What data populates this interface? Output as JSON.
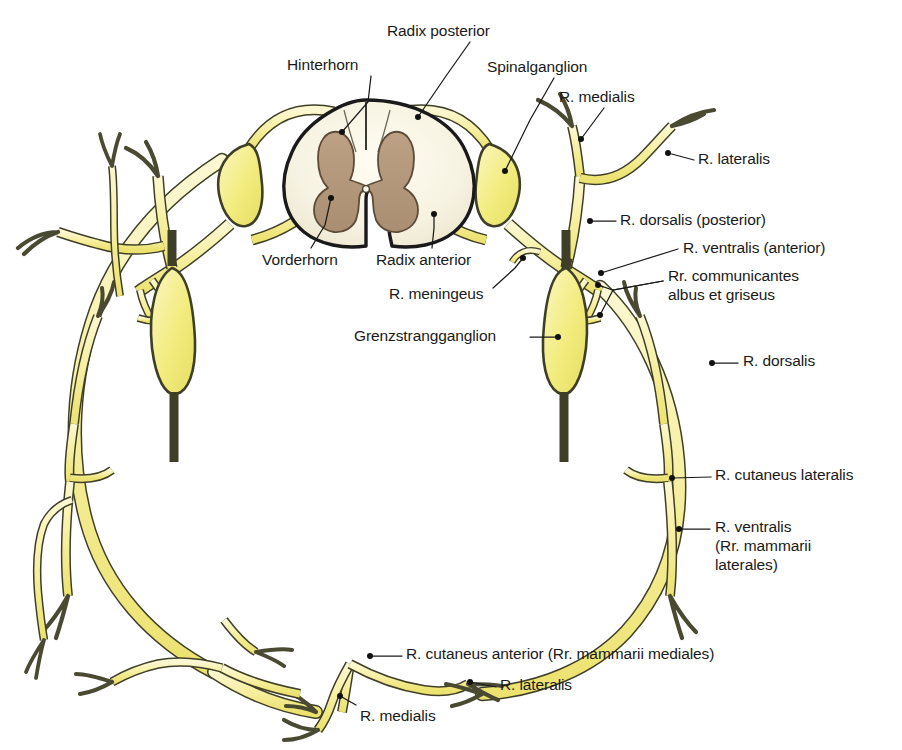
{
  "figure": {
    "language": "de-la",
    "background_color": "#ffffff"
  },
  "colors": {
    "nerve_fill": "#f7f0a4",
    "nerve_fill_light": "#fbf6c6",
    "ganglion_fill": "#f2ec7e",
    "nerve_stroke": "#3f3f28",
    "white_matter_fill": "#f7f4e4",
    "gray_matter_fill": "#b2977b",
    "cord_stroke": "#1a1a1a",
    "label_text": "#1a1a1a",
    "leader_line": "#1a1a1a"
  },
  "structures": {
    "spinal_cord": {
      "name": "spinal-cord-cross-section",
      "white_matter": "white matter (substantia alba)",
      "gray_matter": "gray matter (substantia grisea)",
      "central_canal": "canalis centralis"
    },
    "spinal_ganglion": "Spinalganglion",
    "sympathetic_ganglion": "Grenzstrangganglion"
  },
  "labels": [
    {
      "id": "radix-posterior",
      "text": "Radix posterior",
      "x": 387,
      "y": 22,
      "align": "left",
      "leader": [
        [
          470,
          42
        ],
        [
          446,
          76
        ],
        [
          418,
          117
        ]
      ],
      "dot": [
        418,
        117
      ]
    },
    {
      "id": "hinterhorn",
      "text": "Hinterhorn",
      "x": 287,
      "y": 56,
      "align": "left",
      "leader": [
        [
          371,
          76
        ],
        [
          368,
          102
        ],
        [
          342,
          132
        ]
      ],
      "dot": [
        342,
        132
      ]
    },
    {
      "id": "spinalganglion",
      "text": "Spinalganglion",
      "x": 487,
      "y": 58,
      "align": "left",
      "leader": [
        [
          554,
          78
        ],
        [
          530,
          120
        ],
        [
          505,
          171
        ]
      ],
      "dot": [
        505,
        171
      ]
    },
    {
      "id": "r-medialis-top",
      "text": "R. medialis",
      "x": 559,
      "y": 88,
      "align": "left",
      "leader": [
        [
          604,
          108
        ],
        [
          581,
          139
        ]
      ],
      "dot": [
        581,
        139
      ]
    },
    {
      "id": "r-lateralis-top",
      "text": "R. lateralis",
      "x": 698,
      "y": 150,
      "align": "left",
      "leader": [
        [
          694,
          160
        ],
        [
          668,
          153
        ]
      ],
      "dot": [
        668,
        153
      ]
    },
    {
      "id": "r-dorsalis-posterior",
      "text": "R. dorsalis (posterior)",
      "x": 620,
      "y": 211,
      "align": "left",
      "leader": [
        [
          616,
          221
        ],
        [
          590,
          221
        ]
      ],
      "dot": [
        590,
        221
      ]
    },
    {
      "id": "r-ventralis-anterior",
      "text": "R. ventralis (anterior)",
      "x": 683,
      "y": 239,
      "align": "left",
      "leader": [
        [
          678,
          249
        ],
        [
          601,
          273
        ]
      ],
      "dot": [
        601,
        273
      ]
    },
    {
      "id": "rr-communicantes",
      "text": "Rr. communicantes\nalbus et griseus",
      "x": 668,
      "y": 267,
      "align": "left",
      "leader": [
        [
          663,
          281
        ],
        [
          613,
          290
        ],
        [
          598,
          285
        ]
      ],
      "leader2": [
        [
          663,
          281
        ],
        [
          613,
          290
        ],
        [
          600,
          315
        ]
      ],
      "dot": [
        598,
        285
      ],
      "dot2": [
        600,
        315
      ]
    },
    {
      "id": "r-dorsalis",
      "text": "R. dorsalis",
      "x": 743,
      "y": 352,
      "align": "left",
      "leader": [
        [
          738,
          363
        ],
        [
          712,
          363
        ]
      ],
      "dot": [
        712,
        363
      ]
    },
    {
      "id": "r-cutaneus-lateralis",
      "text": "R. cutaneus lateralis",
      "x": 715,
      "y": 466,
      "align": "left",
      "leader": [
        [
          711,
          477
        ],
        [
          672,
          478
        ]
      ],
      "dot": [
        672,
        478
      ]
    },
    {
      "id": "r-ventralis-mammarii",
      "text": "R. ventralis\n(Rr. mammarii\nlaterales)",
      "x": 715,
      "y": 518,
      "align": "left",
      "leader": [
        [
          710,
          529
        ],
        [
          679,
          529
        ]
      ],
      "dot": [
        679,
        529
      ]
    },
    {
      "id": "vorderhorn",
      "text": "Vorderhorn",
      "x": 262,
      "y": 251,
      "align": "left",
      "leader": [
        [
          311,
          248
        ],
        [
          325,
          225
        ],
        [
          331,
          198
        ]
      ],
      "dot": [
        331,
        198
      ]
    },
    {
      "id": "radix-anterior",
      "text": "Radix anterior",
      "x": 376,
      "y": 251,
      "align": "left",
      "leader": [
        [
          432,
          248
        ],
        [
          434,
          228
        ],
        [
          434,
          214
        ]
      ],
      "dot": [
        434,
        214
      ]
    },
    {
      "id": "r-meningeus",
      "text": "R. meningeus",
      "x": 389,
      "y": 285,
      "align": "left",
      "leader": [
        [
          493,
          288
        ],
        [
          515,
          268
        ],
        [
          523,
          258
        ]
      ],
      "dot": [
        523,
        258
      ]
    },
    {
      "id": "grenzstrangganglion",
      "text": "Grenzstrangganglion",
      "x": 354,
      "y": 327,
      "align": "left",
      "leader": [
        [
          530,
          337
        ],
        [
          558,
          337
        ]
      ],
      "dot": [
        558,
        337
      ]
    },
    {
      "id": "r-cutaneus-anterior",
      "text": "R. cutaneus anterior (Rr. mammarii mediales)",
      "x": 406,
      "y": 645,
      "align": "left",
      "leader": [
        [
          402,
          656
        ],
        [
          370,
          656
        ]
      ],
      "dot": [
        370,
        656
      ]
    },
    {
      "id": "r-lateralis-bottom",
      "text": "R. lateralis",
      "x": 500,
      "y": 676,
      "align": "left",
      "leader": [
        [
          496,
          687
        ],
        [
          470,
          682
        ]
      ],
      "dot": [
        470,
        682
      ]
    },
    {
      "id": "r-medialis-bottom",
      "text": "R. medialis",
      "x": 360,
      "y": 707,
      "align": "left",
      "leader": [
        [
          356,
          705
        ],
        [
          340,
          696
        ]
      ],
      "dot": [
        340,
        696
      ]
    }
  ]
}
